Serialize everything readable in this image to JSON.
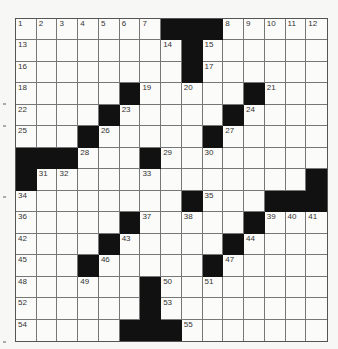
{
  "puzzle": {
    "size": 15,
    "legend": {
      "black": "#",
      "white": "."
    },
    "rows": [
      [
        "1",
        "2",
        "3",
        "4",
        "5",
        "6",
        "7",
        "#",
        "#",
        "#",
        "8",
        "9",
        "10",
        "11",
        "12"
      ],
      [
        "13",
        ".",
        ".",
        ".",
        ".",
        ".",
        ".",
        "14",
        "#",
        "15",
        ".",
        ".",
        ".",
        ".",
        "."
      ],
      [
        "16",
        ".",
        ".",
        ".",
        ".",
        ".",
        ".",
        ".",
        "#",
        "17",
        ".",
        ".",
        ".",
        ".",
        "."
      ],
      [
        "18",
        ".",
        ".",
        ".",
        ".",
        "#",
        "19",
        ".",
        "20",
        ".",
        ".",
        "#",
        "21",
        ".",
        "."
      ],
      [
        "22",
        ".",
        ".",
        ".",
        "#",
        "23",
        ".",
        ".",
        ".",
        ".",
        "#",
        "24",
        ".",
        ".",
        "."
      ],
      [
        "25",
        ".",
        ".",
        "#",
        "26",
        ".",
        ".",
        ".",
        ".",
        "#",
        "27",
        ".",
        ".",
        ".",
        "."
      ],
      [
        "#",
        "#",
        "#",
        "28",
        ".",
        ".",
        "#",
        "29",
        ".",
        "30",
        ".",
        ".",
        ".",
        ".",
        "."
      ],
      [
        "#",
        "31",
        "32",
        ".",
        ".",
        ".",
        "33",
        ".",
        ".",
        ".",
        ".",
        ".",
        ".",
        ".",
        "#"
      ],
      [
        "34",
        ".",
        ".",
        ".",
        ".",
        ".",
        ".",
        ".",
        "#",
        "35",
        ".",
        ".",
        "#",
        "#",
        "#"
      ],
      [
        "36",
        ".",
        ".",
        ".",
        ".",
        "#",
        "37",
        ".",
        "38",
        ".",
        ".",
        "#",
        "39",
        "40",
        "41"
      ],
      [
        "42",
        ".",
        ".",
        ".",
        "#",
        "43",
        ".",
        ".",
        ".",
        ".",
        "#",
        "44",
        ".",
        ".",
        "."
      ],
      [
        "45",
        ".",
        ".",
        "#",
        "46",
        ".",
        ".",
        ".",
        ".",
        "#",
        "47",
        ".",
        ".",
        ".",
        "."
      ],
      [
        "48",
        ".",
        ".",
        "49",
        ".",
        ".",
        "#",
        "50",
        ".",
        "51",
        ".",
        ".",
        ".",
        ".",
        "."
      ],
      [
        "52",
        ".",
        ".",
        ".",
        ".",
        ".",
        "#",
        "53",
        ".",
        ".",
        ".",
        ".",
        ".",
        ".",
        "."
      ],
      [
        "54",
        ".",
        ".",
        ".",
        ".",
        "#",
        "#",
        "#",
        "55",
        ".",
        ".",
        ".",
        ".",
        ".",
        "."
      ]
    ]
  },
  "colors": {
    "black_cell": "#111111",
    "white_cell": "#fbfbf9",
    "grid_line": "#777777"
  }
}
